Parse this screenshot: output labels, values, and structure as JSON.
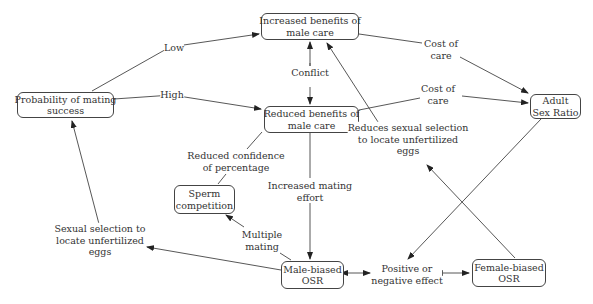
{
  "nodes": {
    "probability": "Probability of mating\nsuccess",
    "increased": "Increased benefits of\nmale care",
    "reduced": "Reduced benefits of\nmale care",
    "adult": "Adult\nSex Ratio",
    "sperm": "Sperm\ncompetition",
    "male_osr": "Male-biased\nOSR",
    "female_osr": "Female-biased\nOSR"
  },
  "labels": {
    "low": "Low",
    "high": "High",
    "conflict": "Conflict",
    "cost1": "Cost of\ncare",
    "cost2": "Cost of\ncare",
    "reduced_conf": "Reduced confidence\nof percentage",
    "increased_mating": "Increased mating\neffort",
    "reduces_sexsel": "Reduces sexual selection\nto locate unfertilized\neggs",
    "sexsel": "Sexual selection to\nlocate unfertilized\neggs",
    "multiple": "Multiple\nmating",
    "posneg": "Positive or\nnegative effect"
  }
}
